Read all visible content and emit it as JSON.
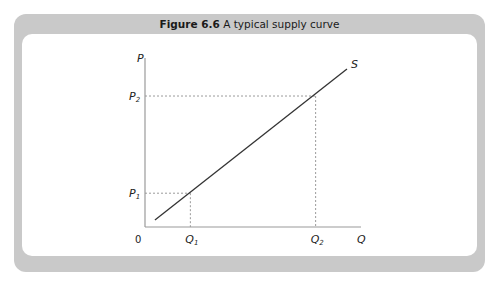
{
  "figure": {
    "number_label": "Figure 6.6",
    "caption": "A typical supply curve"
  },
  "chart_data": {
    "type": "line",
    "title": "A typical supply curve",
    "xlabel": "Q",
    "ylabel": "P",
    "origin_label": "0",
    "xlim": [
      0,
      10
    ],
    "ylim": [
      0,
      10
    ],
    "grid": false,
    "series": [
      {
        "name": "S",
        "label": "S",
        "x": [
          0.46,
          9.35
        ],
        "y": [
          0.41,
          9.35
        ]
      }
    ],
    "reference_points": [
      {
        "x_label": "Q",
        "x_sub": "1",
        "y_label": "P",
        "y_sub": "1",
        "x": 2.1,
        "y": 2.0
      },
      {
        "x_label": "Q",
        "x_sub": "2",
        "y_label": "P",
        "y_sub": "2",
        "x": 7.9,
        "y": 7.75
      }
    ],
    "colors": {
      "axis": "#9a9a9a",
      "curve": "#333333",
      "guide": "#9a9a9a",
      "panel_border": "#c9c9c9"
    }
  }
}
